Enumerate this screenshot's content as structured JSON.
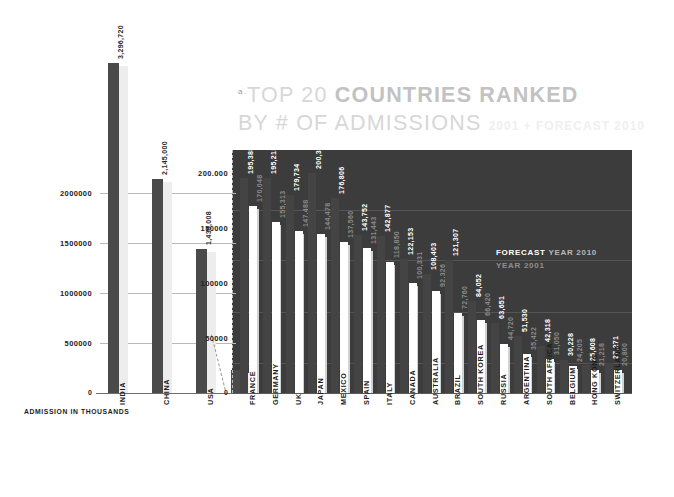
{
  "title": {
    "marker": "a.",
    "line1_plain": "TOP 20 ",
    "line1_strong": "COUNTRIES RANKED",
    "line2_plain": "BY # OF ADMISSIONS",
    "line2_sub": "2001 + FORECAST 2010"
  },
  "legend": {
    "forecast_word": "FORECAST",
    "forecast_year": " YEAR 2010",
    "year_2001": "YEAR 2001"
  },
  "axis": {
    "left_caption": "ADMISSION IN THOUSANDS",
    "zero": "0",
    "left_ticks": [
      "2000000",
      "1500000",
      "1000000",
      "500000"
    ],
    "right_ticks": [
      "200.000",
      "150000",
      "100000",
      "50000"
    ]
  },
  "colors": {
    "panel_bg": "#3c3c3c",
    "bar_dark": "#4a4a4a",
    "bar_white": "#ffffff",
    "page_bg": "#ffffff",
    "title_gray": "#d7d7d7"
  },
  "chart_data": {
    "type": "bar",
    "title": "TOP 20 COUNTRIES RANKED BY # OF ADMISSIONS",
    "subtitle": "2001 + FORECAST 2010",
    "xlabel": "",
    "ylabel": "ADMISSION IN THOUSANDS",
    "grid": true,
    "legend_position": "inside-right",
    "series": [
      {
        "name": "FORECAST YEAR 2010",
        "color": "#4a4a4a"
      },
      {
        "name": "YEAR 2001",
        "color": "#ffffff"
      }
    ],
    "left_panel": {
      "ylim": [
        0,
        2400000
      ],
      "yticks": [
        500000,
        1000000,
        1500000,
        2000000
      ],
      "categories": [
        "INDIA",
        "CHINA",
        "USA"
      ],
      "values": [
        3296720,
        2145000,
        1435008
      ],
      "labels": [
        "3,296,720",
        "2,145,000",
        "1,435,008"
      ]
    },
    "right_panel": {
      "ylim": [
        0,
        215000
      ],
      "yticks": [
        50000,
        100000,
        150000,
        200000
      ],
      "categories": [
        "FRANCE",
        "GERMANY",
        "UK",
        "JAPAN",
        "MEXICO",
        "SPAIN",
        "ITALY",
        "CANADA",
        "AUSTRALIA",
        "BRAZIL",
        "SOUTH KOREA",
        "RUSSIA",
        "ARGENTINA",
        "SOUTH AFRICA",
        "BELGIUM",
        "HONG KONG",
        "SWITZERLAND"
      ],
      "forecast_2010": [
        195388,
        195213,
        179734,
        200325,
        176806,
        143752,
        142877,
        122153,
        108403,
        121307,
        84052,
        63651,
        51530,
        42318,
        30228,
        25608,
        27271
      ],
      "forecast_2010_labels": [
        "195,388",
        "195,213",
        "179,734",
        "200,325",
        "176,806",
        "143,752",
        "142,877",
        "122,153",
        "108,403",
        "121,307",
        "84,052",
        "63,651",
        "51,530",
        "42,318",
        "30,228",
        "25,608",
        "27,271"
      ],
      "year_2001": [
        170048,
        155313,
        147488,
        144478,
        137560,
        131443,
        118850,
        100331,
        92326,
        72760,
        66420,
        44720,
        35422,
        31050,
        24205,
        21218,
        20800
      ],
      "year_2001_labels": [
        "170,048",
        "155,313",
        "147,488",
        "144,478",
        "137,560",
        "131,443",
        "118,850",
        "100,331",
        "92,326",
        "72,760",
        "66,420",
        "44,720",
        "35,422",
        "31,050",
        "24,205",
        "21,218",
        "20,800"
      ]
    }
  }
}
